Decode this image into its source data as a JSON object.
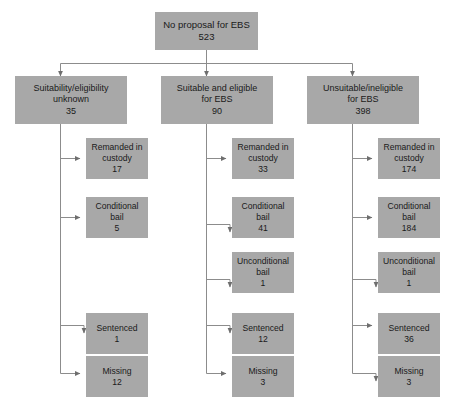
{
  "diagram": {
    "type": "flowchart",
    "title_text": "",
    "colors": {
      "node_fill": "#a8a8a8",
      "node_text": "#1a1a1a",
      "connector": "#8c8c8c",
      "background": "#ffffff"
    },
    "root": {
      "label": "No proposal for EBS",
      "value": "523"
    },
    "branches": [
      {
        "id": "suitability-unknown",
        "label": "Suitability/eligibility\nunknown",
        "value": "35",
        "leaves": [
          {
            "id": "remanded-in-custody",
            "label": "Remanded in\ncustody",
            "value": "17"
          },
          {
            "id": "conditional-bail",
            "label": "Conditional\nbail",
            "value": "5"
          },
          {
            "id": "sentenced",
            "label": "Sentenced",
            "value": "1"
          },
          {
            "id": "missing",
            "label": "Missing",
            "value": "12"
          }
        ]
      },
      {
        "id": "suitable-eligible",
        "label": "Suitable and eligible\nfor EBS",
        "value": "90",
        "leaves": [
          {
            "id": "remanded-in-custody",
            "label": "Remanded in\ncustody",
            "value": "33"
          },
          {
            "id": "conditional-bail",
            "label": "Conditional\nbail",
            "value": "41"
          },
          {
            "id": "unconditional-bail",
            "label": "Unconditional\nbail",
            "value": "1"
          },
          {
            "id": "sentenced",
            "label": "Sentenced",
            "value": "12"
          },
          {
            "id": "missing",
            "label": "Missing",
            "value": "3"
          }
        ]
      },
      {
        "id": "unsuitable-ineligible",
        "label": "Unsuitable/ineligible\nfor EBS",
        "value": "398",
        "leaves": [
          {
            "id": "remanded-in-custody",
            "label": "Remanded in\ncustody",
            "value": "174"
          },
          {
            "id": "conditional-bail",
            "label": "Conditional\nbail",
            "value": "184"
          },
          {
            "id": "unconditional-bail",
            "label": "Unconditional\nbail",
            "value": "1"
          },
          {
            "id": "sentenced",
            "label": "Sentenced",
            "value": "36"
          },
          {
            "id": "missing",
            "label": "Missing",
            "value": "3"
          }
        ]
      }
    ]
  }
}
